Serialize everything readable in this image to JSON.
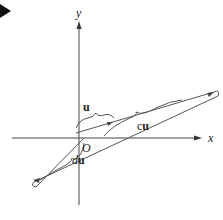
{
  "diagram": {
    "colors": {
      "line": "#444444",
      "pointer": "#111111",
      "background": "#ffffff"
    },
    "axes": {
      "x_label": "x",
      "y_label": "y",
      "origin_label": "O"
    },
    "vectors": [
      {
        "id": "u",
        "label": "u",
        "description": "vector u from origin along the line"
      },
      {
        "id": "cu",
        "label": "cu",
        "label_prefix": "c",
        "label_vector": "u",
        "description": "positive scalar multiple cu, longer than u"
      },
      {
        "id": "du",
        "label": "du",
        "label_prefix": "d",
        "label_vector": "u",
        "description": "negative scalar multiple du, pointing opposite direction"
      }
    ],
    "pointer_icon": "triangle-right"
  }
}
